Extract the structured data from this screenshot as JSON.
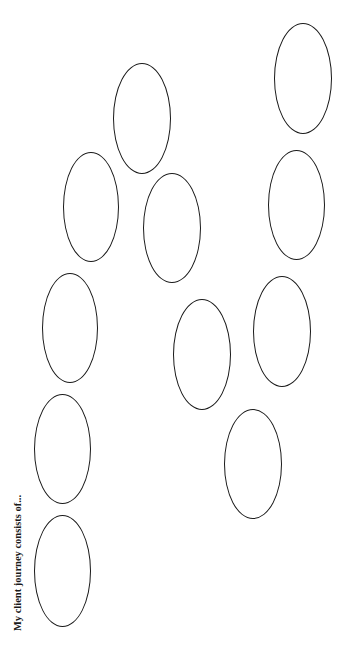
{
  "worksheet": {
    "heading": "My client journey consists of...",
    "stroke_color": "#1a1a1a",
    "background_color": "#ffffff",
    "ovals": [
      {
        "id": "oval-1",
        "x": 34,
        "y": 515,
        "w": 57,
        "h": 112
      },
      {
        "id": "oval-2",
        "x": 34,
        "y": 394,
        "w": 57,
        "h": 110
      },
      {
        "id": "oval-3",
        "x": 42,
        "y": 273,
        "w": 56,
        "h": 110
      },
      {
        "id": "oval-4",
        "x": 63,
        "y": 152,
        "w": 56,
        "h": 110
      },
      {
        "id": "oval-5",
        "x": 113,
        "y": 63,
        "w": 58,
        "h": 111
      },
      {
        "id": "oval-6",
        "x": 143,
        "y": 173,
        "w": 58,
        "h": 110
      },
      {
        "id": "oval-7",
        "x": 173,
        "y": 299,
        "w": 58,
        "h": 111
      },
      {
        "id": "oval-8",
        "x": 224,
        "y": 409,
        "w": 58,
        "h": 110
      },
      {
        "id": "oval-9",
        "x": 253,
        "y": 276,
        "w": 58,
        "h": 111
      },
      {
        "id": "oval-10",
        "x": 268,
        "y": 150,
        "w": 57,
        "h": 110
      },
      {
        "id": "oval-11",
        "x": 274,
        "y": 23,
        "w": 58,
        "h": 111
      }
    ]
  }
}
